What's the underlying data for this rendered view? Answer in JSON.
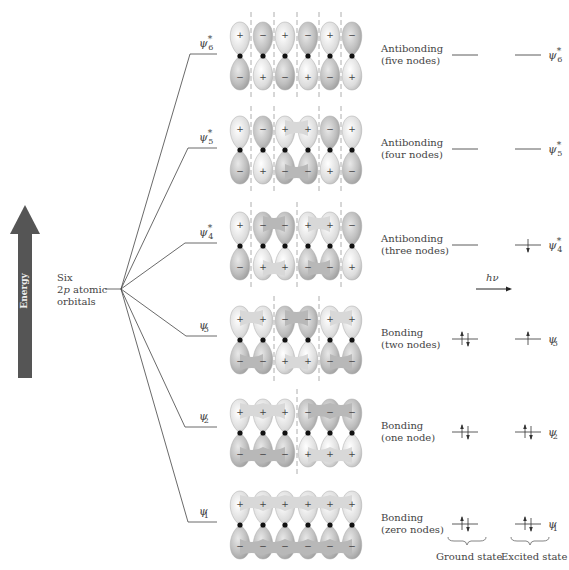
{
  "energy_axis": {
    "label": "Energy",
    "color": "#555555"
  },
  "atomic_orbitals": {
    "line1": "Six",
    "line2_p1": "2",
    "line2_italic": "p",
    "line2_p2": " atomic",
    "line3": "orbitals"
  },
  "photon": {
    "label": "hν"
  },
  "levels": [
    {
      "id": "psi6",
      "psi": "ψ",
      "sub": "6",
      "star": "*",
      "type": "Antibonding",
      "nodes": "(five nodes)",
      "y": 56,
      "signs_top": [
        "+",
        "−",
        "+",
        "−",
        "+",
        "−"
      ],
      "signs_bottom": [
        "−",
        "+",
        "−",
        "+",
        "−",
        "+"
      ],
      "node_lines": [
        251,
        274,
        297,
        319,
        341
      ],
      "ground": "",
      "excited": ""
    },
    {
      "id": "psi5",
      "psi": "ψ",
      "sub": "5",
      "star": "*",
      "type": "Antibonding",
      "nodes": "(four nodes)",
      "y": 150,
      "signs_top": [
        "+",
        "−",
        "+",
        "+",
        "−",
        "+"
      ],
      "signs_bottom": [
        "−",
        "+",
        "−",
        "−",
        "+",
        "−"
      ],
      "node_lines": [
        251,
        274,
        319,
        341
      ],
      "ground": "",
      "excited": ""
    },
    {
      "id": "psi4",
      "psi": "ψ",
      "sub": "4",
      "star": "*",
      "type": "Antibonding",
      "nodes": "(three nodes)",
      "y": 246,
      "signs_top": [
        "+",
        "−",
        "−",
        "+",
        "+",
        "−"
      ],
      "signs_bottom": [
        "−",
        "+",
        "+",
        "−",
        "−",
        "+"
      ],
      "node_lines": [
        251,
        297,
        341
      ],
      "ground": "",
      "excited": "down"
    },
    {
      "id": "psi3",
      "psi": "ψ",
      "sub": "3",
      "star": "",
      "type": "Bonding",
      "nodes": "(two nodes)",
      "y": 340,
      "signs_top": [
        "+",
        "+",
        "−",
        "−",
        "+",
        "+"
      ],
      "signs_bottom": [
        "−",
        "−",
        "+",
        "+",
        "−",
        "−"
      ],
      "node_lines": [
        274,
        319
      ],
      "ground": "pair",
      "excited": "up"
    },
    {
      "id": "psi2",
      "psi": "ψ",
      "sub": "2",
      "star": "",
      "type": "Bonding",
      "nodes": "(one node)",
      "y": 433,
      "signs_top": [
        "+",
        "+",
        "+",
        "−",
        "−",
        "−"
      ],
      "signs_bottom": [
        "−",
        "−",
        "−",
        "+",
        "+",
        "+"
      ],
      "node_lines": [
        297
      ],
      "ground": "pair",
      "excited": "pair"
    },
    {
      "id": "psi1",
      "psi": "ψ",
      "sub": "1",
      "star": "",
      "type": "Bonding",
      "nodes": "(zero nodes)",
      "y": 525,
      "signs_top": [
        "+",
        "+",
        "+",
        "+",
        "+",
        "+"
      ],
      "signs_bottom": [
        "−",
        "−",
        "−",
        "−",
        "−",
        "−"
      ],
      "node_lines": [],
      "ground": "pair",
      "excited": "pair"
    }
  ],
  "footer": {
    "ground_state": "Ground state",
    "excited_state": "Excited state"
  }
}
